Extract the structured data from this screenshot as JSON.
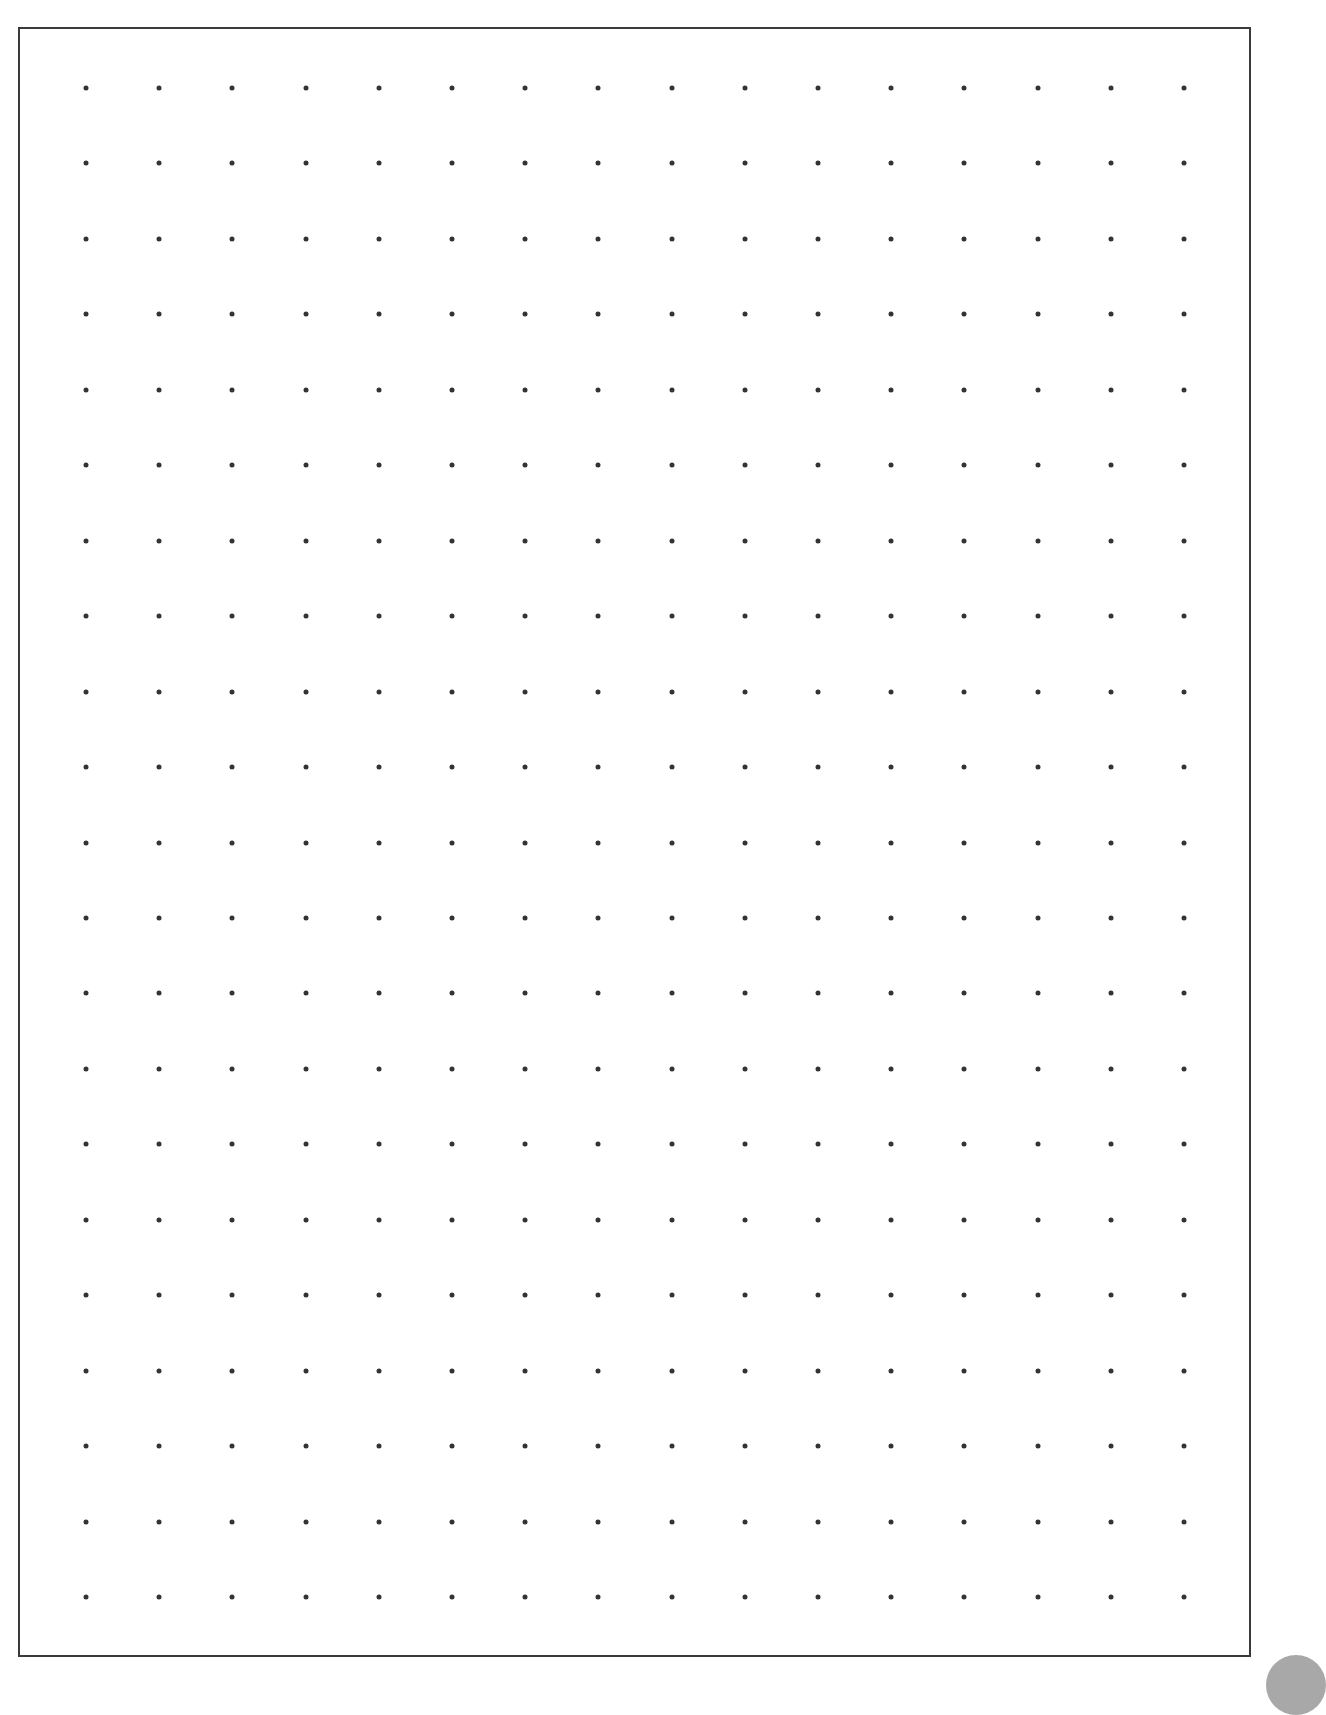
{
  "page": {
    "type": "dot-grid-paper",
    "background_color": "#ffffff",
    "border_color": "#3a3a3a",
    "dot_color": "#333333"
  },
  "grid": {
    "columns": 16,
    "rows": 21,
    "origin_x": 86,
    "origin_y": 88,
    "spacing_x": 73.2,
    "spacing_y": 75.45,
    "dot_diameter": 5
  },
  "corner_badge": {
    "color": "#a8a8a8"
  }
}
